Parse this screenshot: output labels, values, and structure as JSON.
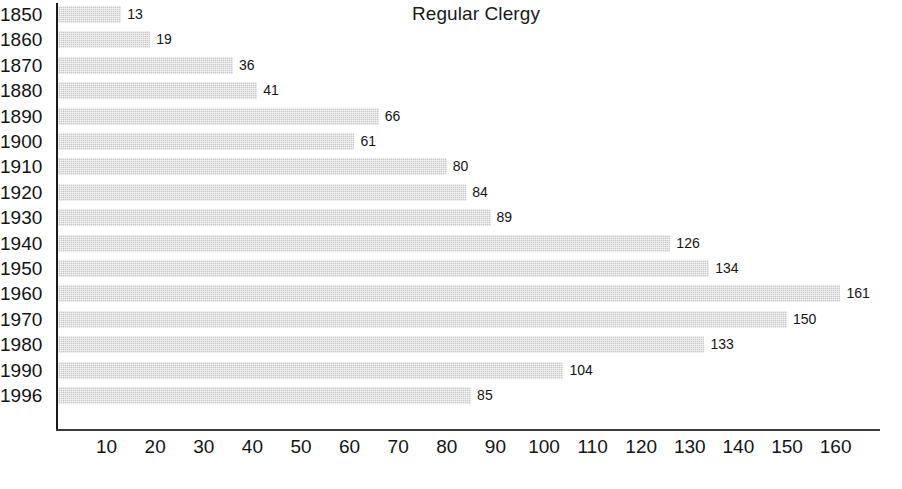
{
  "chart_data": {
    "type": "bar",
    "orientation": "horizontal",
    "title": "Regular Clergy",
    "xlabel": "",
    "ylabel": "",
    "categories": [
      "1850",
      "1860",
      "1870",
      "1880",
      "1890",
      "1900",
      "1910",
      "1920",
      "1930",
      "1940",
      "1950",
      "1960",
      "1970",
      "1980",
      "1990",
      "1996"
    ],
    "values": [
      13,
      19,
      36,
      41,
      66,
      61,
      80,
      84,
      89,
      126,
      134,
      161,
      150,
      133,
      104,
      85
    ],
    "value_labels": [
      "13",
      "19",
      "36",
      "41",
      "66",
      "61",
      "80",
      "84",
      "89",
      "126",
      "134",
      "161",
      "150",
      "133",
      "104",
      "85"
    ],
    "xlim": [
      0,
      170
    ],
    "xticks": [
      10,
      20,
      30,
      40,
      50,
      60,
      70,
      80,
      90,
      100,
      110,
      120,
      130,
      140,
      150,
      160
    ],
    "xtick_labels": [
      "10",
      "20",
      "30",
      "40",
      "50",
      "60",
      "70",
      "80",
      "90",
      "100",
      "110",
      "120",
      "130",
      "140",
      "150",
      "160"
    ],
    "grid": false,
    "legend": null,
    "bar_color": "#c9c9c9",
    "axis_color": "#1b1b1b",
    "text_color": "#141414",
    "background": "#ffffff"
  }
}
